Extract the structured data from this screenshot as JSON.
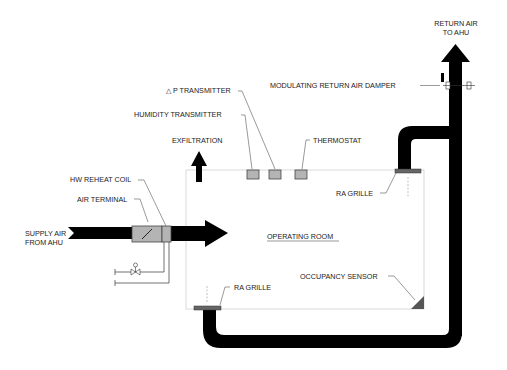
{
  "diagram": {
    "room_label": "OPERATING ROOM",
    "labels": {
      "return_air": [
        "RETURN AIR",
        "TO AHU"
      ],
      "damper": "MODULATING RETURN AIR DAMPER",
      "dp_transmitter": "△ P TRANSMITTER",
      "humidity_transmitter": "HUMIDITY TRANSMITTER",
      "exfiltration": "EXFILTRATION",
      "thermostat": "THERMOSTAT",
      "ra_grille_top": "RA GRILLE",
      "hw_reheat_coil": "HW REHEAT COIL",
      "air_terminal": "AIR TERMINAL",
      "supply_air": [
        "SUPPLY AIR",
        "FROM AHU"
      ],
      "ra_grille_bottom": "RA GRILLE",
      "occupancy_sensor": "OCCUPANCY SENSOR"
    },
    "colors": {
      "duct": "#000000",
      "device_fill": "#b4b4b4",
      "room_outline": "#d0d0d0",
      "text": "#222222"
    }
  }
}
